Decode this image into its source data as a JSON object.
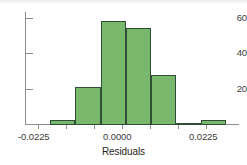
{
  "chart_data": {
    "type": "bar",
    "title": "",
    "subtitle": "",
    "xlabel": "Residuals",
    "ylabel": "",
    "grid": false,
    "legend": null,
    "xlim": [
      -0.03,
      0.03375
    ],
    "ylim": [
      0,
      65
    ],
    "bin_width": 0.0075,
    "x_tick_labels": [
      "-0.0225",
      "0.0000",
      "0.0225"
    ],
    "x_tick_values": [
      -0.0225,
      0.0,
      0.0225
    ],
    "y_tick_labels": [
      "20",
      "40",
      "60"
    ],
    "y_tick_values": [
      20,
      40,
      60
    ],
    "bins": [
      {
        "left": -0.0225,
        "right": -0.015,
        "value": 3
      },
      {
        "left": -0.015,
        "right": -0.0075,
        "value": 22
      },
      {
        "left": -0.0075,
        "right": 0.0,
        "value": 60
      },
      {
        "left": 0.0,
        "right": 0.0075,
        "value": 56
      },
      {
        "left": 0.0075,
        "right": 0.015,
        "value": 29
      },
      {
        "left": 0.015,
        "right": 0.0225,
        "value": 1
      },
      {
        "left": 0.0225,
        "right": 0.03,
        "value": 3
      }
    ],
    "categories": [
      "-0.0225",
      "-0.015",
      "-0.0075",
      "0.0000",
      "0.0075",
      "0.015",
      "0.0225"
    ],
    "values": [
      3,
      22,
      60,
      56,
      29,
      1,
      3
    ],
    "colors": {
      "bar_fill": "#79b86c",
      "bar_edge": "#2f4f35",
      "axis": "#8d8d8d",
      "text": "#231f20",
      "background": "#ffffff"
    }
  }
}
